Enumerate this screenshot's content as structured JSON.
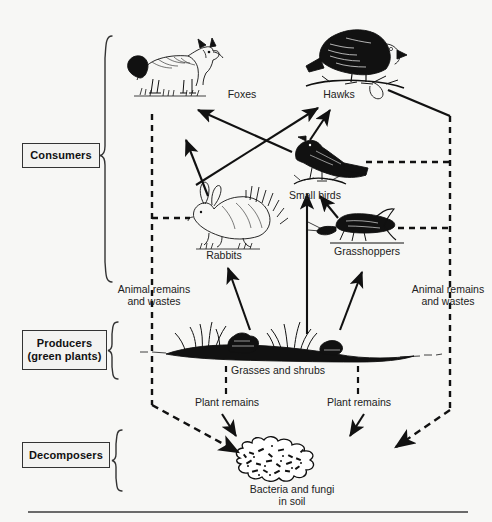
{
  "diagram": {
    "ink_color": "#111111",
    "box_border_color": "#333333",
    "baseline_color": "#6a6a6a"
  },
  "categories": [
    {
      "id": "consumers",
      "label": "Consumers"
    },
    {
      "id": "producers",
      "label": "Producers\n(green plants)",
      "line1": "Producers",
      "line2": "(green plants)"
    },
    {
      "id": "decomposers",
      "label": "Decomposers"
    }
  ],
  "organisms": [
    {
      "id": "foxes",
      "label": "Foxes",
      "icon": "fox-illustration"
    },
    {
      "id": "hawks",
      "label": "Hawks",
      "icon": "hawk-illustration"
    },
    {
      "id": "small-birds",
      "label": "Small birds",
      "icon": "bird-illustration"
    },
    {
      "id": "rabbits",
      "label": "Rabbits",
      "icon": "rabbit-illustration"
    },
    {
      "id": "grasshoppers",
      "label": "Grasshoppers",
      "icon": "grasshopper-illustration"
    },
    {
      "id": "grasses",
      "label": "Grasses and shrubs",
      "icon": "grass-shrub-illustration"
    },
    {
      "id": "bacteria",
      "label": "Bacteria and fungi\nin soil",
      "line1": "Bacteria and fungi",
      "line2": "in soil",
      "icon": "soil-blob-illustration"
    }
  ],
  "flow_labels": [
    {
      "id": "animal-remains-left",
      "line1": "Animal remains",
      "line2": "and wastes"
    },
    {
      "id": "animal-remains-right",
      "line1": "Animal remains",
      "line2": "and wastes"
    },
    {
      "id": "plant-remains-left",
      "text": "Plant remains"
    },
    {
      "id": "plant-remains-right",
      "text": "Plant remains"
    }
  ],
  "energy_flows": [
    {
      "from": "rabbits",
      "to": "foxes",
      "style": "solid-arrow"
    },
    {
      "from": "rabbits",
      "to": "hawks",
      "style": "solid-arrow"
    },
    {
      "from": "small-birds",
      "to": "foxes",
      "style": "solid-arrow"
    },
    {
      "from": "small-birds",
      "to": "hawks",
      "style": "solid-arrow"
    },
    {
      "from": "grasshoppers",
      "to": "small-birds",
      "style": "solid-arrow"
    },
    {
      "from": "grasses",
      "to": "rabbits",
      "style": "solid-arrow"
    },
    {
      "from": "grasses",
      "to": "small-birds",
      "style": "solid-arrow"
    },
    {
      "from": "grasses",
      "to": "grasshoppers",
      "style": "solid-arrow"
    },
    {
      "from": "consumers-left",
      "to": "bacteria",
      "style": "dashed-arrow",
      "label": "Animal remains and wastes"
    },
    {
      "from": "consumers-right",
      "to": "bacteria",
      "style": "dashed-arrow",
      "label": "Animal remains and wastes"
    },
    {
      "from": "grasses",
      "to": "bacteria",
      "style": "dashed-arrow",
      "label": "Plant remains"
    }
  ]
}
